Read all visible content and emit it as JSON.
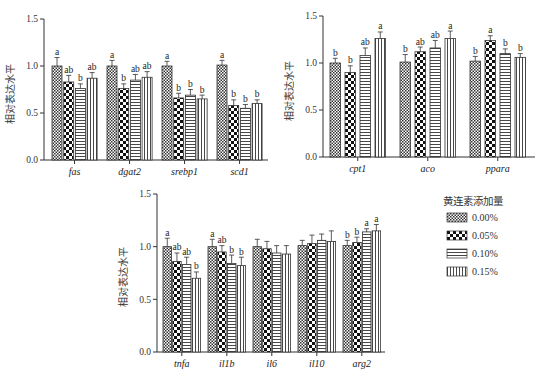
{
  "legend": {
    "title": "黄连素添加量",
    "items": [
      {
        "label": "0.00%",
        "pattern": "fine-checker"
      },
      {
        "label": "0.05%",
        "pattern": "coarse-checker"
      },
      {
        "label": "0.10%",
        "pattern": "horizontal-lines"
      },
      {
        "label": "0.15%",
        "pattern": "vertical-lines"
      }
    ]
  },
  "chart_data": [
    {
      "type": "bar",
      "title": "",
      "xlabel": "",
      "ylabel": "相对表达水平",
      "ylim": [
        0,
        1.5
      ],
      "yticks": [
        "0.0",
        "0.5",
        "1.0",
        "1.5"
      ],
      "categories": [
        "fas",
        "dgat2",
        "srebp1",
        "scd1"
      ],
      "series": [
        {
          "name": "0.00%",
          "values": [
            1.0,
            1.0,
            1.0,
            1.01
          ],
          "errors": [
            0.09,
            0.06,
            0.05,
            0.05
          ],
          "sig": [
            "a",
            "a",
            "a",
            "a"
          ]
        },
        {
          "name": "0.05%",
          "values": [
            0.83,
            0.76,
            0.66,
            0.58
          ],
          "errors": [
            0.07,
            0.05,
            0.05,
            0.06
          ],
          "sig": [
            "ab",
            "b",
            "b",
            "b"
          ]
        },
        {
          "name": "0.10%",
          "values": [
            0.76,
            0.85,
            0.69,
            0.55
          ],
          "errors": [
            0.05,
            0.06,
            0.06,
            0.04
          ],
          "sig": [
            "b",
            "ab",
            "b",
            "b"
          ]
        },
        {
          "name": "0.15%",
          "values": [
            0.87,
            0.88,
            0.65,
            0.6
          ],
          "errors": [
            0.06,
            0.06,
            0.04,
            0.04
          ],
          "sig": [
            "ab",
            "ab",
            "b",
            "b"
          ]
        }
      ]
    },
    {
      "type": "bar",
      "title": "",
      "xlabel": "",
      "ylabel": "相对表达水平",
      "ylim": [
        0,
        1.5
      ],
      "yticks": [
        "0.0",
        "0.5",
        "1.0",
        "1.5"
      ],
      "categories": [
        "cpt1",
        "aco",
        "ppara"
      ],
      "series": [
        {
          "name": "0.00%",
          "values": [
            1.0,
            1.01,
            1.02
          ],
          "errors": [
            0.05,
            0.08,
            0.05
          ],
          "sig": [
            "b",
            "b",
            "b"
          ]
        },
        {
          "name": "0.05%",
          "values": [
            0.9,
            1.12,
            1.24
          ],
          "errors": [
            0.07,
            0.05,
            0.05
          ],
          "sig": [
            "b",
            "ab",
            "a"
          ]
        },
        {
          "name": "0.10%",
          "values": [
            1.08,
            1.16,
            1.1
          ],
          "errors": [
            0.08,
            0.08,
            0.05
          ],
          "sig": [
            "ab",
            "ab",
            "b"
          ]
        },
        {
          "name": "0.15%",
          "values": [
            1.26,
            1.26,
            1.06
          ],
          "errors": [
            0.07,
            0.08,
            0.04
          ],
          "sig": [
            "a",
            "a",
            "b"
          ]
        }
      ]
    },
    {
      "type": "bar",
      "title": "",
      "xlabel": "",
      "ylabel": "相对表达水平",
      "ylim": [
        0,
        1.5
      ],
      "yticks": [
        "0.0",
        "0.5",
        "1.0",
        "1.5"
      ],
      "categories": [
        "tnfa",
        "il1b",
        "il6",
        "il10",
        "arg2"
      ],
      "series": [
        {
          "name": "0.00%",
          "values": [
            1.0,
            1.0,
            1.0,
            1.01,
            1.01
          ],
          "errors": [
            0.08,
            0.07,
            0.07,
            0.05,
            0.05
          ],
          "sig": [
            "a",
            "a",
            "",
            "",
            "b"
          ]
        },
        {
          "name": "0.05%",
          "values": [
            0.86,
            0.95,
            0.98,
            1.03,
            1.04
          ],
          "errors": [
            0.08,
            0.06,
            0.07,
            0.08,
            0.05
          ],
          "sig": [
            "ab",
            "ab",
            "",
            "",
            "b"
          ]
        },
        {
          "name": "0.10%",
          "values": [
            0.83,
            0.84,
            0.94,
            1.06,
            1.14
          ],
          "errors": [
            0.07,
            0.08,
            0.07,
            0.06,
            0.03
          ],
          "sig": [
            "ab",
            "b",
            "",
            "",
            "a"
          ]
        },
        {
          "name": "0.15%",
          "values": [
            0.7,
            0.82,
            0.93,
            1.05,
            1.15
          ],
          "errors": [
            0.06,
            0.08,
            0.08,
            0.1,
            0.06
          ],
          "sig": [
            "b",
            "b",
            "",
            "",
            "a"
          ]
        }
      ]
    }
  ]
}
